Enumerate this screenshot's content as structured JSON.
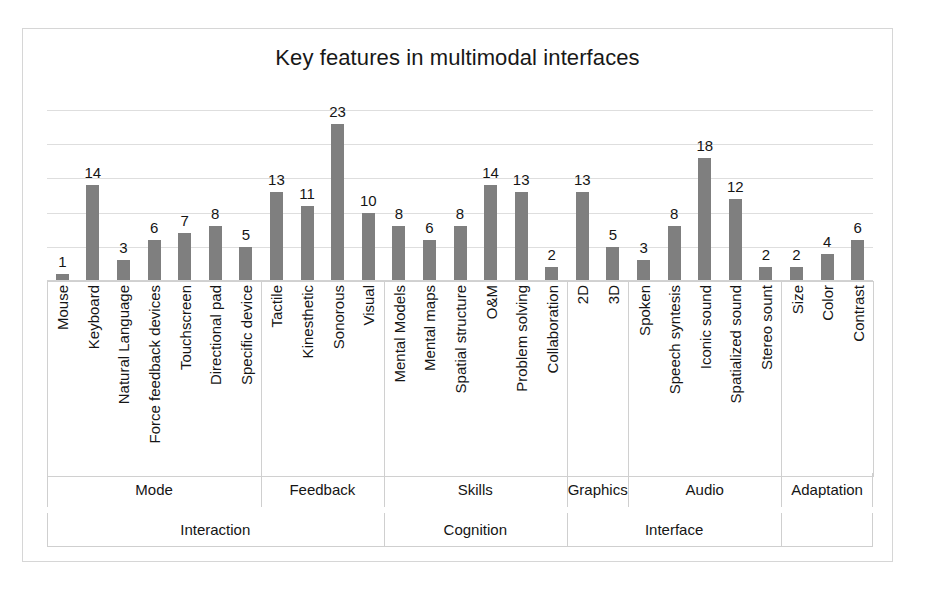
{
  "figure": {
    "title": "Key features in multimodal interfaces",
    "bar_color": "#7f7f7f",
    "grid_color": "#dedede",
    "border_color": "#d6d6d6"
  },
  "chart_data": {
    "type": "bar",
    "title": "Key features in multimodal interfaces",
    "xlabel": "",
    "ylabel": "",
    "ylim": [
      0,
      25
    ],
    "grid": true,
    "gridlines": [
      5,
      10,
      15,
      20,
      25
    ],
    "legend": "none",
    "orientation": "vertical",
    "data_labels": true,
    "categories": [
      "Mouse",
      "Keyboard",
      "Natural Language",
      "Force feedback devices",
      "Touchscreen",
      "Directional pad",
      "Specific device",
      "Tactile",
      "Kinesthetic",
      "Sonorous",
      "Visual",
      "Mental Models",
      "Mental maps",
      "Spatial structure",
      "O&M",
      "Problem solving",
      "Collaboration",
      "2D",
      "3D",
      "Spoken",
      "Speech syntesis",
      "Iconic sound",
      "Spatialized sound",
      "Stereo sount",
      "Size",
      "Color",
      "Contrast"
    ],
    "values": [
      1,
      14,
      3,
      6,
      7,
      8,
      5,
      13,
      11,
      23,
      10,
      8,
      6,
      8,
      14,
      13,
      2,
      13,
      5,
      3,
      8,
      18,
      12,
      2,
      2,
      4,
      6
    ],
    "groups_level1": [
      {
        "label": "Mode",
        "span": 7
      },
      {
        "label": "Feedback",
        "span": 4
      },
      {
        "label": "Skills",
        "span": 6
      },
      {
        "label": "Graphics",
        "span": 2
      },
      {
        "label": "Audio",
        "span": 5
      },
      {
        "label": "Adaptation",
        "span": 3
      }
    ],
    "groups_level2": [
      {
        "label": "Interaction",
        "span": 11
      },
      {
        "label": "Cognition",
        "span": 6
      },
      {
        "label": "Interface",
        "span": 7
      },
      {
        "label": "",
        "span": 3
      }
    ]
  }
}
